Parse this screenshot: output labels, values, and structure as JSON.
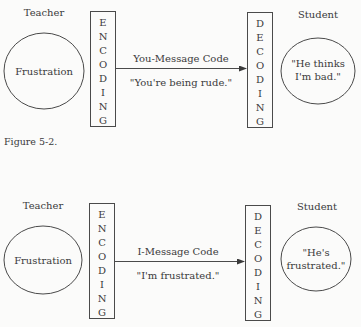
{
  "figures": [
    {
      "sender_label": "Teacher",
      "sender_feeling": "Frustration",
      "encoding_letters": [
        "E",
        "N",
        "C",
        "O",
        "D",
        "I",
        "N",
        "G"
      ],
      "code_label": "You-Message Code",
      "message": "\"You're being rude.\"",
      "decoding_letters": [
        "D",
        "E",
        "C",
        "O",
        "D",
        "I",
        "N",
        "G"
      ],
      "receiver_label": "Student",
      "receiver_interpretation": [
        "\"He thinks",
        "I'm bad.\""
      ]
    },
    {
      "sender_label": "Teacher",
      "sender_feeling": "Frustration",
      "encoding_letters": [
        "E",
        "N",
        "C",
        "O",
        "D",
        "I",
        "N",
        "G"
      ],
      "code_label": "I-Message Code",
      "message": "\"I'm frustrated.\"",
      "decoding_letters": [
        "D",
        "E",
        "C",
        "O",
        "D",
        "I",
        "N",
        "G"
      ],
      "receiver_label": "Student",
      "receiver_interpretation": [
        "\"He's",
        "frustrated.\""
      ]
    }
  ],
  "caption": "Figure 5-2.",
  "colors": {
    "line": "#4a4a4a",
    "text": "#3a3a3a",
    "background": "#fbfbfa"
  }
}
